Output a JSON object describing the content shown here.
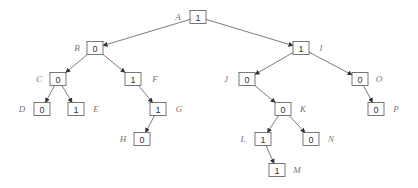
{
  "diagram": {
    "type": "binary-tree",
    "box": {
      "width": 16,
      "height": 13
    },
    "colors": {
      "edge": "#444444",
      "box_border": "#555555",
      "label": "#777777",
      "value": "#333333"
    },
    "nodes": [
      {
        "id": "A",
        "label": "A",
        "value": "1",
        "x": 198,
        "y": 17,
        "lx": 178
      },
      {
        "id": "B",
        "label": "B",
        "value": "0",
        "x": 95,
        "y": 48,
        "lx": 77
      },
      {
        "id": "I",
        "label": "I",
        "value": "1",
        "x": 301,
        "y": 48,
        "lx": 321
      },
      {
        "id": "C",
        "label": "C",
        "value": "0",
        "x": 58,
        "y": 79,
        "lx": 39
      },
      {
        "id": "F",
        "label": "F",
        "value": "1",
        "x": 133,
        "y": 79,
        "lx": 155
      },
      {
        "id": "J",
        "label": "J",
        "value": "0",
        "x": 247,
        "y": 79,
        "lx": 226
      },
      {
        "id": "O",
        "label": "O",
        "value": "0",
        "x": 360,
        "y": 79,
        "lx": 379
      },
      {
        "id": "D",
        "label": "D",
        "value": "0",
        "x": 42,
        "y": 109,
        "lx": 22
      },
      {
        "id": "E",
        "label": "E",
        "value": "1",
        "x": 76,
        "y": 109,
        "lx": 96
      },
      {
        "id": "G",
        "label": "G",
        "value": "1",
        "x": 158,
        "y": 109,
        "lx": 179
      },
      {
        "id": "K",
        "label": "K",
        "value": "0",
        "x": 283,
        "y": 109,
        "lx": 303
      },
      {
        "id": "P",
        "label": "P",
        "value": "0",
        "x": 376,
        "y": 109,
        "lx": 396
      },
      {
        "id": "H",
        "label": "H",
        "value": "0",
        "x": 142,
        "y": 139,
        "lx": 123
      },
      {
        "id": "L",
        "label": "L",
        "value": "1",
        "x": 263,
        "y": 139,
        "lx": 243
      },
      {
        "id": "N",
        "label": "N",
        "value": "0",
        "x": 311,
        "y": 139,
        "lx": 331
      },
      {
        "id": "M",
        "label": "M",
        "value": "1",
        "x": 277,
        "y": 170,
        "lx": 297
      }
    ],
    "edges": [
      [
        "A",
        "B"
      ],
      [
        "A",
        "I"
      ],
      [
        "B",
        "C"
      ],
      [
        "B",
        "F"
      ],
      [
        "C",
        "D"
      ],
      [
        "C",
        "E"
      ],
      [
        "F",
        "G"
      ],
      [
        "G",
        "H"
      ],
      [
        "I",
        "J"
      ],
      [
        "I",
        "O"
      ],
      [
        "J",
        "K"
      ],
      [
        "K",
        "L"
      ],
      [
        "K",
        "N"
      ],
      [
        "L",
        "M"
      ],
      [
        "O",
        "P"
      ]
    ]
  }
}
